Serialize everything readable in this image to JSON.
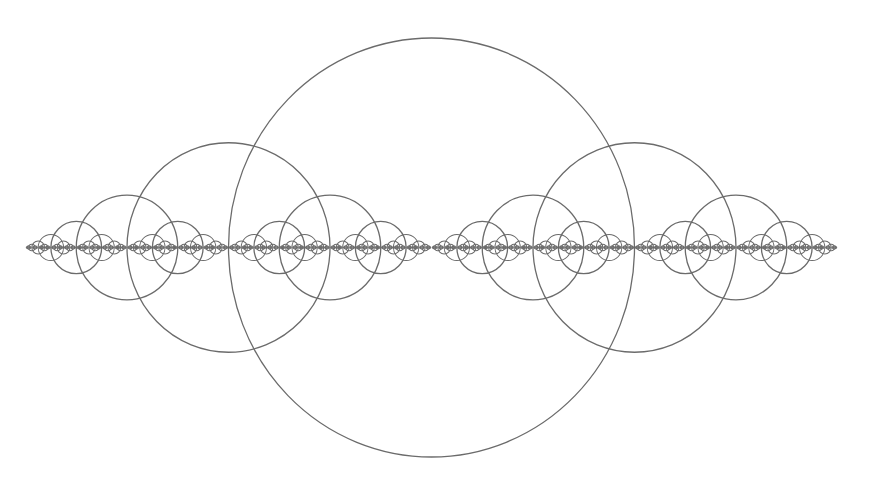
{
  "figure": {
    "title": "",
    "width": 872,
    "height": 483,
    "background": "#ffffff",
    "stroke_color": "#6b6b6b",
    "stroke_width": 1.3,
    "root": {
      "cx": 431.5,
      "cy": 247.5,
      "rx": 203,
      "ry": 209.5
    },
    "scale_per_level": 0.5,
    "depth": 8
  }
}
